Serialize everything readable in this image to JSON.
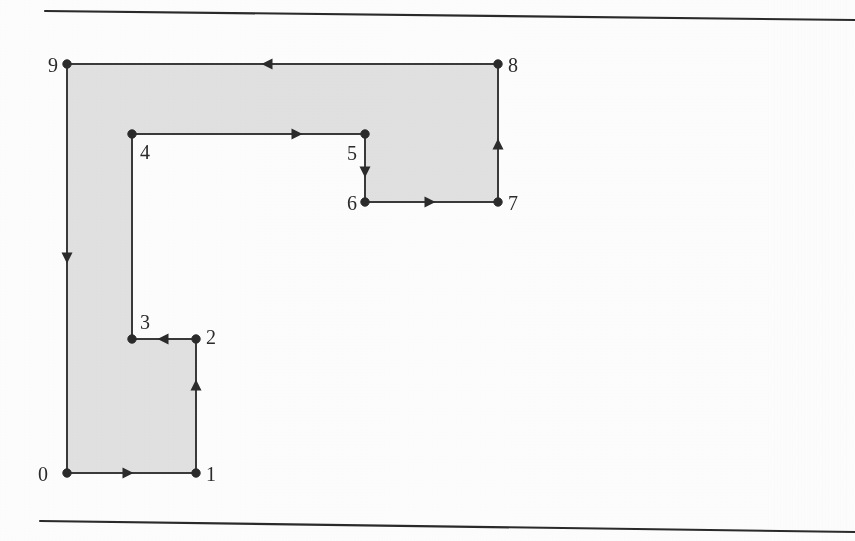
{
  "figure": {
    "title": "",
    "description": "Shaded rectilinear polygon with ten numbered vertices and directed edges",
    "fill_color": "#e3e3e3",
    "stroke_color": "#3a3a3a",
    "label_color": "#2b2b2b",
    "width": 855,
    "height": 541
  },
  "rules": [
    {
      "name": "top-rule",
      "x1": 45,
      "y1": 11,
      "x2": 855,
      "y2": 20
    },
    {
      "name": "bottom-rule",
      "x1": 40,
      "y1": 521,
      "x2": 855,
      "y2": 532
    }
  ],
  "vertices": [
    {
      "id": "0",
      "label": "0",
      "x": 67,
      "y": 473,
      "label_x": 48,
      "label_y": 481,
      "anchor": "end"
    },
    {
      "id": "1",
      "label": "1",
      "x": 196,
      "y": 473,
      "label_x": 206,
      "label_y": 481,
      "anchor": "start"
    },
    {
      "id": "2",
      "label": "2",
      "x": 196,
      "y": 339,
      "label_x": 206,
      "label_y": 344,
      "anchor": "start"
    },
    {
      "id": "3",
      "label": "3",
      "x": 132,
      "y": 339,
      "label_x": 140,
      "label_y": 329,
      "anchor": "start"
    },
    {
      "id": "4",
      "label": "4",
      "x": 132,
      "y": 134,
      "label_x": 140,
      "label_y": 159,
      "anchor": "start"
    },
    {
      "id": "5",
      "label": "5",
      "x": 365,
      "y": 134,
      "label_x": 357,
      "label_y": 160,
      "anchor": "end"
    },
    {
      "id": "6",
      "label": "6",
      "x": 365,
      "y": 202,
      "label_x": 357,
      "label_y": 210,
      "anchor": "end"
    },
    {
      "id": "7",
      "label": "7",
      "x": 498,
      "y": 202,
      "label_x": 508,
      "label_y": 210,
      "anchor": "start"
    },
    {
      "id": "8",
      "label": "8",
      "x": 498,
      "y": 64,
      "label_x": 508,
      "label_y": 72,
      "anchor": "start"
    },
    {
      "id": "9",
      "label": "9",
      "x": 67,
      "y": 64,
      "label_x": 58,
      "label_y": 72,
      "anchor": "end"
    }
  ],
  "edges": [
    {
      "from": "0",
      "to": "1",
      "direction": "right",
      "arrow_x": 128,
      "arrow_y": 473
    },
    {
      "from": "1",
      "to": "2",
      "direction": "up",
      "arrow_x": 196,
      "arrow_y": 385
    },
    {
      "from": "2",
      "to": "3",
      "direction": "left",
      "arrow_x": 163,
      "arrow_y": 339
    },
    {
      "from": "3",
      "to": "4",
      "direction": "up",
      "arrow_x": null,
      "arrow_y": null
    },
    {
      "from": "4",
      "to": "5",
      "direction": "right",
      "arrow_x": 297,
      "arrow_y": 134
    },
    {
      "from": "5",
      "to": "6",
      "direction": "down",
      "arrow_x": 365,
      "arrow_y": 172
    },
    {
      "from": "6",
      "to": "7",
      "direction": "right",
      "arrow_x": 430,
      "arrow_y": 202
    },
    {
      "from": "7",
      "to": "8",
      "direction": "up",
      "arrow_x": 498,
      "arrow_y": 144
    },
    {
      "from": "8",
      "to": "9",
      "direction": "left",
      "arrow_x": 267,
      "arrow_y": 64
    },
    {
      "from": "9",
      "to": "0",
      "direction": "down",
      "arrow_x": 67,
      "arrow_y": 258
    }
  ],
  "polygon_path": "M 67 473 L 196 473 L 196 339 L 132 339 L 132 134 L 365 134 L 365 202 L 498 202 L 498 64 L 67 64 Z"
}
